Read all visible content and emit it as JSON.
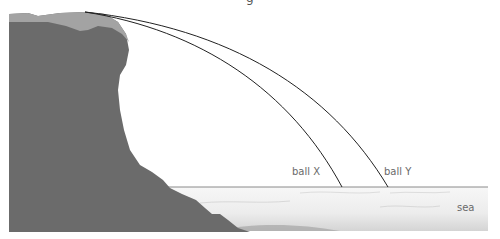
{
  "diagram": {
    "title_fragment": "g",
    "labels": {
      "ball_x": "ball X",
      "ball_y": "ball Y",
      "sea": "sea"
    },
    "colors": {
      "cliff": "#6b6b6b",
      "cliff_top": "#a3a3a3",
      "sea_light": "#f4f4f4",
      "sea_dark": "#cfcfcf",
      "sea_line": "#8a8a8a",
      "trajectory": "#222222",
      "label_text": "#6a6a6a"
    },
    "trajectories": [
      {
        "name": "ball X",
        "start": [
          85,
          12
        ],
        "end": [
          342,
          187
        ]
      },
      {
        "name": "ball Y",
        "start": [
          85,
          12
        ],
        "end": [
          388,
          187
        ]
      }
    ]
  }
}
